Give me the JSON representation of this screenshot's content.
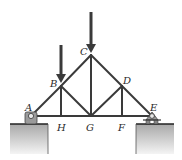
{
  "diagram": {
    "type": "truss",
    "colors": {
      "member": "#3a3a3a",
      "ground": "#b8b8b8",
      "ground_edge": "#222222",
      "support": "#9a9a9a"
    },
    "joints": {
      "A": {
        "label": "A",
        "x": 31,
        "y": 116
      },
      "B": {
        "label": "B",
        "x": 61,
        "y": 86
      },
      "C": {
        "label": "C",
        "x": 91,
        "y": 55
      },
      "D": {
        "label": "D",
        "x": 122,
        "y": 86
      },
      "E": {
        "label": "E",
        "x": 152,
        "y": 116
      },
      "F": {
        "label": "F",
        "x": 122,
        "y": 116
      },
      "G": {
        "label": "G",
        "x": 91,
        "y": 116
      },
      "H": {
        "label": "H",
        "x": 61,
        "y": 116
      }
    },
    "members": [
      "AB",
      "BC",
      "CD",
      "DE",
      "AH",
      "HG",
      "GF",
      "FE",
      "BH",
      "BG",
      "CG",
      "DG",
      "DF"
    ],
    "loads": [
      {
        "at": "C",
        "direction": "down"
      },
      {
        "at": "B",
        "direction": "down"
      }
    ],
    "supports": [
      {
        "at": "A",
        "type": "pin"
      },
      {
        "at": "E",
        "type": "roller"
      }
    ]
  }
}
